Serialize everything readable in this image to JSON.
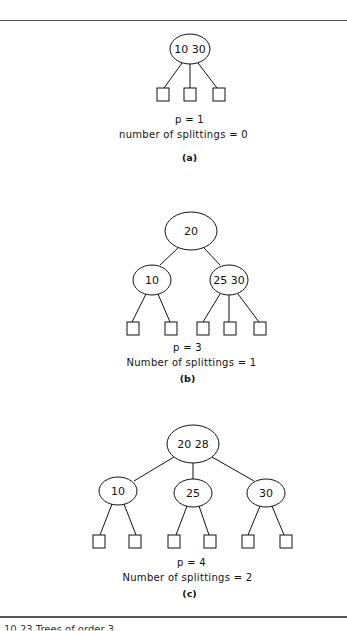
{
  "figure": {
    "panels": [
      {
        "id": "a",
        "p_label": "p = 1",
        "splits_label": "number of splittings = 0",
        "sub_label": "(a)",
        "nodes": [
          {
            "keys": [
              "10",
              "30"
            ]
          }
        ]
      },
      {
        "id": "b",
        "p_label": "p = 3",
        "splits_label": "Number of splittings = 1",
        "sub_label": "(b)",
        "nodes": [
          {
            "keys": [
              "20"
            ]
          },
          {
            "keys": [
              "10"
            ]
          },
          {
            "keys": [
              "25",
              "30"
            ]
          }
        ]
      },
      {
        "id": "c",
        "p_label": "p = 4",
        "splits_label": "Number of splittings = 2",
        "sub_label": "(c)",
        "nodes": [
          {
            "keys": [
              "20",
              "28"
            ]
          },
          {
            "keys": [
              "10"
            ]
          },
          {
            "keys": [
              "25"
            ]
          },
          {
            "keys": [
              "30"
            ]
          }
        ]
      }
    ],
    "caption": "10.23 Trees of order 3"
  },
  "text": {
    "a_root": "10 30",
    "b_root": "20",
    "b_left": "10",
    "b_right": "25 30",
    "c_root": "20 28",
    "c_left": "10",
    "c_mid": "25",
    "c_right": "30"
  }
}
